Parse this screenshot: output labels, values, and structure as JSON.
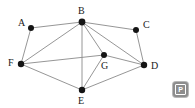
{
  "figure": {
    "background_color": "#ffffff",
    "edge_color": "#8a8a8a",
    "node_color": "#141414",
    "label_color": "#1a1a1a"
  },
  "graph": {
    "nodes": [
      {
        "id": "A",
        "label": "A",
        "x": 31,
        "y": 28,
        "r": 3.0,
        "label_x": 18,
        "label_y": 26
      },
      {
        "id": "B",
        "label": "B",
        "x": 82,
        "y": 22,
        "r": 3.4,
        "label_x": 78,
        "label_y": 14
      },
      {
        "id": "C",
        "label": "C",
        "x": 136,
        "y": 30,
        "r": 3.0,
        "label_x": 143,
        "label_y": 28
      },
      {
        "id": "D",
        "label": "D",
        "x": 144,
        "y": 65,
        "r": 3.2,
        "label_x": 151,
        "label_y": 69
      },
      {
        "id": "E",
        "label": "E",
        "x": 82,
        "y": 90,
        "r": 3.2,
        "label_x": 78,
        "label_y": 104
      },
      {
        "id": "F",
        "label": "F",
        "x": 21,
        "y": 64,
        "r": 3.2,
        "label_x": 8,
        "label_y": 66
      },
      {
        "id": "G",
        "label": "G",
        "x": 104,
        "y": 55,
        "r": 3.0,
        "label_x": 101,
        "label_y": 69
      }
    ],
    "edges": [
      {
        "from": "A",
        "to": "B"
      },
      {
        "from": "A",
        "to": "F"
      },
      {
        "from": "B",
        "to": "C"
      },
      {
        "from": "B",
        "to": "D"
      },
      {
        "from": "B",
        "to": "E"
      },
      {
        "from": "B",
        "to": "F"
      },
      {
        "from": "B",
        "to": "G"
      },
      {
        "from": "C",
        "to": "D"
      },
      {
        "from": "D",
        "to": "E"
      },
      {
        "from": "D",
        "to": "G"
      },
      {
        "from": "E",
        "to": "F"
      },
      {
        "from": "E",
        "to": "G"
      },
      {
        "from": "F",
        "to": "G"
      }
    ],
    "node_count": 7,
    "edge_count": 13
  },
  "watermark": {
    "label": "P",
    "icon": "letter-p-badge-icon",
    "background_color": "#8d8d8d",
    "text_color": "#ffffff"
  }
}
